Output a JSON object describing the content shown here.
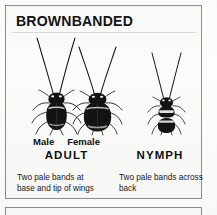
{
  "panel": {
    "title": "BROWNBANDED",
    "species_common_name": "BROWNBANDED",
    "background_color": "#fbfbfa",
    "border_color": "#8d8d8d",
    "ink_color": "#111111"
  },
  "figures": [
    {
      "id": "male-adult",
      "sex_label": "Male",
      "stage": "ADULT",
      "description": "dark elongated winged adult cockroach with long V-shaped antennae"
    },
    {
      "id": "female-adult",
      "sex_label": "Female",
      "stage": "ADULT",
      "description": "dark broad rounded winged adult cockroach with long V-shaped antennae"
    },
    {
      "id": "nymph",
      "sex_label": "",
      "stage": "NYMPH",
      "description": "small wingless nymph with two pale bands across the back"
    }
  ],
  "labels": {
    "male": "Male",
    "female": "Female",
    "adult": "ADULT",
    "nymph": "NYMPH"
  },
  "captions": {
    "adult": {
      "line1": "Two pale bands at",
      "line2": "base and tip of wings"
    },
    "nymph": {
      "line1": "Two pale bands across",
      "line2": "back"
    }
  }
}
